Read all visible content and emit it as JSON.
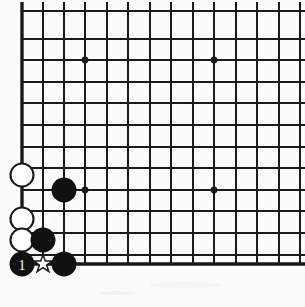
{
  "figure": {
    "kind": "go-board-diagram",
    "title": "",
    "background_color": "#fbfbfa",
    "line_color": "#1a1a1a",
    "black_stone_color": "#111111",
    "white_stone_color": "#ffffff",
    "label_text_color": "#ffffff"
  },
  "board": {
    "origin_x": 22,
    "origin_y": 11,
    "spacing": 21.5,
    "cols_visible": 14,
    "rows_visible": 12,
    "left_edge_x": 22,
    "bottom_edge_y": 264,
    "edge_line_width": 3.4,
    "inner_line_width": 1.9,
    "top_cropped": true,
    "right_cropped": true
  },
  "hoshi_points": [
    {
      "name": "hoshi-top-left",
      "x": 85,
      "y": 60
    },
    {
      "name": "hoshi-top-right",
      "x": 214,
      "y": 60
    },
    {
      "name": "hoshi-bottom-left",
      "x": 85,
      "y": 190
    },
    {
      "name": "hoshi-bottom-right",
      "x": 214,
      "y": 190
    }
  ],
  "stones": [
    {
      "id": "white-1",
      "color": "white",
      "x": 22,
      "y": 175,
      "r": 11.5,
      "label": ""
    },
    {
      "id": "white-2",
      "color": "white",
      "x": 22,
      "y": 219,
      "r": 11.5,
      "label": ""
    },
    {
      "id": "white-3",
      "color": "white",
      "x": 22,
      "y": 240,
      "r": 11.5,
      "label": ""
    },
    {
      "id": "black-1",
      "color": "black",
      "x": 64,
      "y": 190,
      "r": 12.5,
      "label": ""
    },
    {
      "id": "black-2",
      "color": "black",
      "x": 43,
      "y": 240,
      "r": 12.5,
      "label": ""
    },
    {
      "id": "black-3",
      "color": "black",
      "x": 64,
      "y": 264,
      "r": 12.5,
      "label": ""
    },
    {
      "id": "black-move-1",
      "color": "black",
      "x": 22,
      "y": 264,
      "r": 12.5,
      "label": "1"
    }
  ],
  "marks": [
    {
      "id": "star-mark",
      "type": "star-outline",
      "x": 43,
      "y": 264,
      "size": 9,
      "color": "#1a1a1a"
    }
  ],
  "move_numbers": [
    "1"
  ]
}
